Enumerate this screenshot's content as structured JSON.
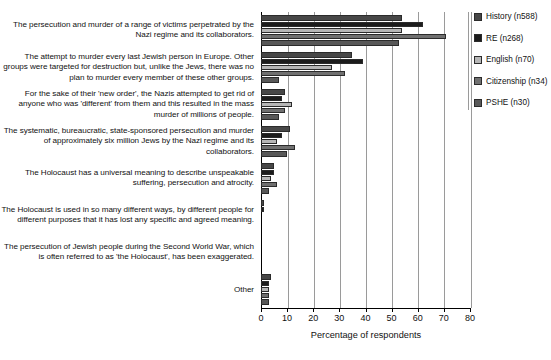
{
  "chart_data": {
    "type": "bar",
    "orientation": "horizontal",
    "title": "",
    "xlabel": "Percentage of respondents",
    "ylabel": "",
    "xlim": [
      0,
      80
    ],
    "xticks": [
      0,
      10,
      20,
      30,
      40,
      50,
      60,
      70,
      80
    ],
    "grid": true,
    "legend_position": "right",
    "categories": [
      "The persecution and murder of a range of victims perpetrated by the Nazi regime and its collaborators.",
      "The attempt to murder every last Jewish person in Europe. Other groups were targeted for destruction but, unlike the Jews, there was no plan to murder every member of these other groups.",
      "For the sake of their 'new order', the Nazis attempted to get rid of anyone who was 'different' from them and this resulted in the mass murder of millions of people.",
      "The systematic, bureaucratic, state-sponsored persecution and murder of approximately six million Jews by the Nazi regime and its collaborators.",
      "The Holocaust has a universal meaning to describe unspeakable suffering, persecution and atrocity.",
      "The Holocaust is used in so many different ways, by different people for different purposes that it has lost any specific and agreed meaning.",
      "The persecution of Jewish people during the Second World War, which is often referred to as 'the Holocaust', has been exaggerated.",
      "Other"
    ],
    "series": [
      {
        "name": "History (n588)",
        "color": "#474747",
        "values": [
          54,
          35,
          9,
          11,
          5,
          1,
          0,
          4
        ]
      },
      {
        "name": "RE (n268)",
        "color": "#1c1c1c",
        "values": [
          62,
          39,
          8,
          8,
          5,
          1,
          0,
          3
        ]
      },
      {
        "name": "English (n70)",
        "color": "#b6b6b6",
        "values": [
          54,
          27,
          12,
          6,
          4,
          0,
          0,
          3
        ]
      },
      {
        "name": "Citizenship (n34)",
        "color": "#707070",
        "values": [
          71,
          32,
          9,
          13,
          6,
          0,
          0,
          3
        ]
      },
      {
        "name": "PSHE (n30)",
        "color": "#585858",
        "values": [
          53,
          7,
          7,
          10,
          3,
          0,
          0,
          3
        ]
      }
    ]
  },
  "legend": {
    "items": [
      {
        "label": "History (n588)"
      },
      {
        "label": "RE (n268)"
      },
      {
        "label": "English (n70)"
      },
      {
        "label": "Citizenship (n34)"
      },
      {
        "label": "PSHE (n30)"
      }
    ]
  },
  "axis": {
    "x_title": "Percentage of respondents",
    "tick_labels": [
      "0",
      "10",
      "20",
      "30",
      "40",
      "50",
      "60",
      "70",
      "80"
    ]
  }
}
